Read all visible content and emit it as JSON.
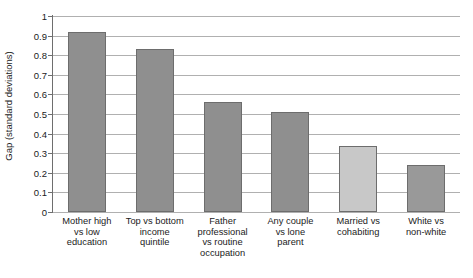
{
  "chart_data": {
    "type": "bar",
    "title": "",
    "xlabel": "",
    "ylabel": "Gap (standard deviations)",
    "ylim": [
      0,
      1
    ],
    "ytick_step": 0.1,
    "grid": true,
    "legend": "none",
    "categories": [
      "Mother high vs low education",
      "Top vs bottom income quintile",
      "Father professional vs routine occupation",
      "Any couple vs lone parent",
      "Married vs cohabiting",
      "White vs non-white"
    ],
    "category_lines": [
      [
        "Mother high",
        "vs low",
        "education"
      ],
      [
        "Top vs bottom",
        "income",
        "quintile"
      ],
      [
        "Father",
        "professional",
        "vs routine",
        "occupation"
      ],
      [
        "Any couple",
        "vs lone",
        "parent"
      ],
      [
        "Married vs",
        "cohabiting"
      ],
      [
        "White vs",
        "non-white"
      ]
    ],
    "values": [
      0.92,
      0.83,
      0.56,
      0.51,
      0.335,
      0.24
    ],
    "ytick_labels": [
      "1",
      "0.9",
      "0.8",
      "0.7",
      "0.6",
      "0.5",
      "0.4",
      "0.3",
      "0.2",
      "0.1",
      "0"
    ],
    "ytick_values": [
      1,
      0.9,
      0.8,
      0.7,
      0.6,
      0.5,
      0.4,
      0.3,
      0.2,
      0.1,
      0
    ],
    "bar_colors": [
      "#8f8f8f",
      "#8f8f8f",
      "#8f8f8f",
      "#8f8f8f",
      "#c8c8c8",
      "#999999"
    ],
    "bar_border_color": "#6d6d6d",
    "gridline_color": "#b0b0b0",
    "axis_color": "#6e6e6e",
    "text_color": "#1b1b1b",
    "background_color": "#ffffff"
  }
}
